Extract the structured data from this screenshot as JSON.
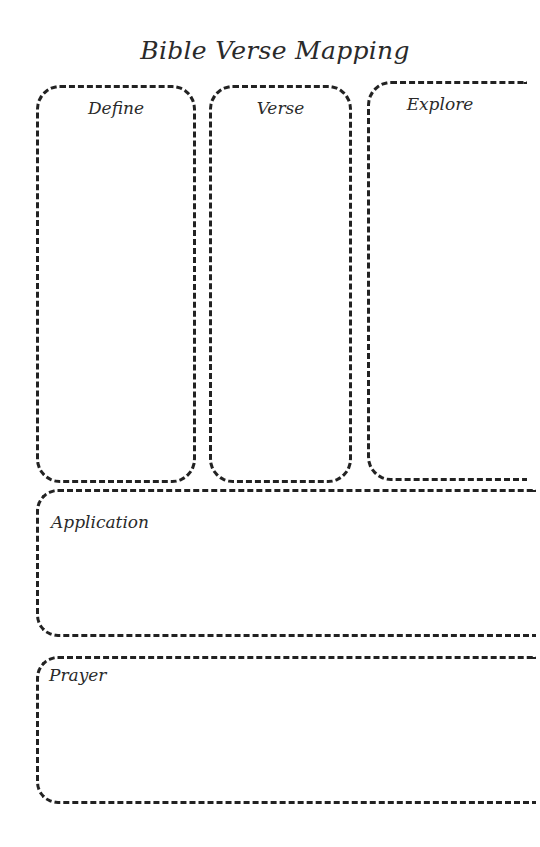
{
  "title": "Bible Verse Mapping",
  "columns": [
    {
      "id": "define",
      "label": "Define"
    },
    {
      "id": "verse",
      "label": "Verse"
    },
    {
      "id": "explore",
      "label": "Explore"
    }
  ],
  "rows": [
    {
      "id": "application",
      "label": "Application"
    },
    {
      "id": "prayer",
      "label": "Prayer"
    }
  ],
  "colors": {
    "ink": "#222222",
    "background": "#ffffff"
  }
}
